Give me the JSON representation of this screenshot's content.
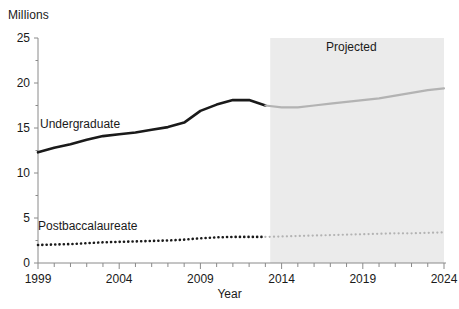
{
  "chart_data": {
    "type": "line",
    "title": "",
    "subtitle": "",
    "unit_label": "Millions",
    "xlabel": "Year",
    "ylabel": "",
    "xlim": [
      1999,
      2024
    ],
    "ylim": [
      0,
      25
    ],
    "ytick_labels": [
      "25",
      "20",
      "15",
      "10",
      "5",
      "0"
    ],
    "ytick_values": [
      25,
      20,
      15,
      10,
      5,
      0
    ],
    "xtick_labels": [
      "1999",
      "2004",
      "2009",
      "2014",
      "2019",
      "2024"
    ],
    "xtick_values": [
      1999,
      2004,
      2009,
      2014,
      2019,
      2024
    ],
    "minor_xticks_every": 1,
    "grid": false,
    "legend_position": "inline-annotations",
    "x": [
      1999,
      2000,
      2001,
      2002,
      2003,
      2004,
      2005,
      2006,
      2007,
      2008,
      2009,
      2010,
      2011,
      2012,
      2013,
      2014,
      2015,
      2016,
      2017,
      2018,
      2019,
      2020,
      2021,
      2022,
      2023,
      2024
    ],
    "series": [
      {
        "name": "Undergraduate",
        "style": "solid",
        "color": "#1a1a1a",
        "projected_color": "#b3b3b3",
        "actual_through": 2013,
        "values": [
          12.3,
          12.8,
          13.2,
          13.7,
          14.1,
          14.3,
          14.5,
          14.8,
          15.1,
          15.6,
          16.9,
          17.6,
          18.1,
          18.1,
          17.5,
          17.3,
          17.3,
          17.5,
          17.7,
          17.9,
          18.1,
          18.3,
          18.6,
          18.9,
          19.2,
          19.4
        ]
      },
      {
        "name": "Postbaccalaureate",
        "style": "dotted",
        "color": "#1a1a1a",
        "projected_color": "#b3b3b3",
        "actual_through": 2013,
        "values": [
          2.0,
          2.05,
          2.1,
          2.2,
          2.3,
          2.35,
          2.4,
          2.45,
          2.5,
          2.6,
          2.75,
          2.85,
          2.9,
          2.9,
          2.9,
          2.95,
          3.0,
          3.05,
          3.1,
          3.15,
          3.2,
          3.25,
          3.3,
          3.3,
          3.35,
          3.4
        ]
      }
    ],
    "annotations": [
      {
        "text": "Projected",
        "x": 2018.0,
        "y": 23.0,
        "region_start": 2013.3,
        "region_end": 2024
      }
    ],
    "shaded_region": {
      "label": "Projected",
      "from": 2013.3,
      "to": 2024,
      "color": "#ebebeb"
    }
  },
  "labels": {
    "unit": "Millions",
    "xaxis_title": "Year",
    "undergraduate": "Undergraduate",
    "postbaccalaureate": "Postbaccalaureate",
    "projected": "Projected"
  }
}
